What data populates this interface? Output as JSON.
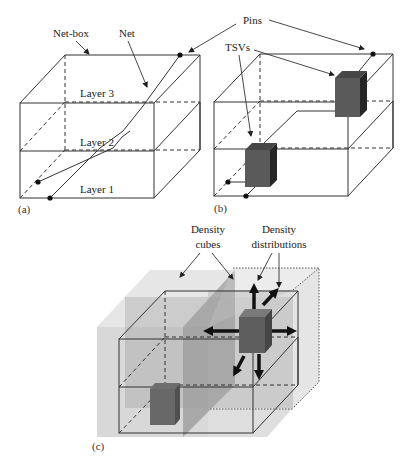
{
  "figure": {
    "panels": [
      {
        "id": "a",
        "caption": "(a)"
      },
      {
        "id": "b",
        "caption": "(b)"
      },
      {
        "id": "c",
        "caption": "(c)"
      }
    ],
    "labels": {
      "net_box": "Net-box",
      "net": "Net",
      "pins": "Pins",
      "tsvs": "TSVs",
      "layer3": "Layer 3",
      "layer2": "Layer 2",
      "layer1": "Layer 1",
      "density_cubes_line1": "Density",
      "density_cubes_line2": "cubes",
      "density_dist_line1": "Density",
      "density_dist_line2": "distributions"
    },
    "colors": {
      "line": "#333333",
      "tsv_front": "#5a5a5a",
      "tsv_side": "#2a2a2a",
      "tsv_top": "#474747",
      "density_light": "#d4d4d4",
      "density_mid": "#a8a8a8",
      "arrow": "#111111"
    }
  }
}
